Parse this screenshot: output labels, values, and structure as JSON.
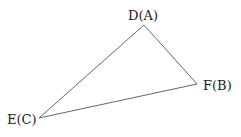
{
  "diagram": {
    "type": "triangle",
    "stroke_color": "#555555",
    "vertices": [
      {
        "id": "D",
        "label": "D(A)",
        "x": 144,
        "y": 25
      },
      {
        "id": "F",
        "label": "F(B)",
        "x": 197,
        "y": 84
      },
      {
        "id": "E",
        "label": "E(C)",
        "x": 39,
        "y": 118
      }
    ],
    "edges": [
      [
        "D",
        "F"
      ],
      [
        "F",
        "E"
      ],
      [
        "E",
        "D"
      ]
    ]
  }
}
